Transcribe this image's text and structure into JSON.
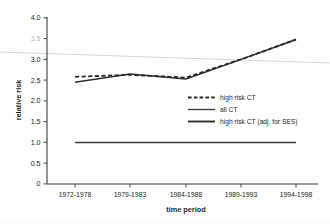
{
  "chart_data": {
    "type": "line",
    "title": "",
    "xlabel": "time period",
    "ylabel": "relative risk",
    "categories": [
      "1972-1978",
      "1979-1983",
      "1984-1988",
      "1989-1993",
      "1994-1998"
    ],
    "ylim": [
      0,
      4.0
    ],
    "yticks": [
      0,
      0.5,
      1.0,
      1.5,
      2.0,
      2.5,
      3.0,
      3.5,
      4.0
    ],
    "ytick_labels": [
      "0",
      "0.5",
      "1.0",
      "1.5",
      "2.0",
      "2.5",
      "3.0",
      "3.5",
      "4.0"
    ],
    "grid": false,
    "legend_position": "center-right",
    "series": [
      {
        "name": "high risk CT",
        "style": "dashed",
        "color": "#2b2a2c",
        "values": [
          2.58,
          2.63,
          2.56,
          3.0,
          3.48
        ]
      },
      {
        "name": "all CT",
        "style": "solid",
        "color": "#3d3c3e",
        "values": [
          1.0,
          1.0,
          1.0,
          1.0,
          1.0
        ]
      },
      {
        "name": "high risk CT (adj. for SES)",
        "style": "solid",
        "color": "#2f2e30",
        "values": [
          2.45,
          2.65,
          2.53,
          3.0,
          3.48
        ]
      }
    ]
  },
  "axes": {
    "y_title": "relative risk",
    "x_title": "time period",
    "y_labels": [
      "4.0",
      "3.5",
      "3.0",
      "2.5",
      "2.0",
      "1.5",
      "1.0",
      "0.5",
      "0"
    ],
    "x_labels": [
      "1972-1978",
      "1979-1983",
      "1984-1988",
      "1989-1993",
      "1994-1998"
    ]
  },
  "legend": {
    "items": [
      {
        "label": "high risk CT",
        "style": "dashed"
      },
      {
        "label": "all CT",
        "style": "solid"
      },
      {
        "label": "high risk CT (adj. for SES)",
        "style": "solid-bold"
      }
    ]
  },
  "colors": {
    "axis": "#3b3a3c",
    "text": "#231f20",
    "series_dashed": "#2b2a2c",
    "series_flat": "#3d3c3e",
    "series_adj": "#2f2e30",
    "background": "#ffffff"
  }
}
